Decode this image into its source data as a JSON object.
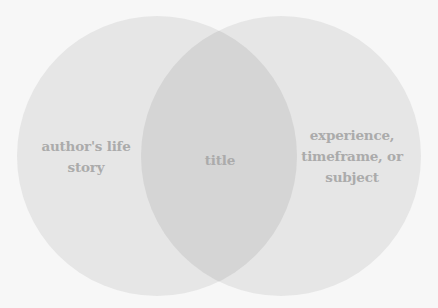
{
  "diagram": {
    "type": "venn",
    "background_color": "#f7f7f7",
    "circle_color": "#e6e6e6",
    "intersection_color": "#d5d5d5",
    "text_color": "#ababab",
    "circles": [
      {
        "name": "left",
        "label_lines": [
          "author's life",
          "story"
        ]
      },
      {
        "name": "right",
        "label_lines": [
          "experience,",
          "timeframe, or",
          "subject"
        ]
      }
    ],
    "intersection": {
      "label_lines": [
        "title"
      ]
    }
  }
}
